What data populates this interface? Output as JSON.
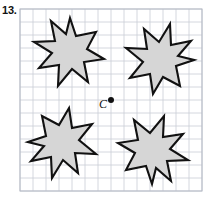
{
  "problem": {
    "number": "13."
  },
  "figure": {
    "type": "rotational-symmetry-grid",
    "center_label": "C",
    "grid": {
      "origin_x": 20,
      "origin_y": 9,
      "cell": 13,
      "cols": 14,
      "rows": 14,
      "line_color": "#c9cdd6",
      "border_color": "#b4b9c4"
    },
    "center_point": {
      "x": 111,
      "y": 100,
      "radius": 3,
      "color": "#111111"
    },
    "shape_style": {
      "fill": "#d6d6d6",
      "stroke": "#111111",
      "stroke_width": 2.1
    },
    "star_points": [
      [
        46,
        4
      ],
      [
        52,
        22
      ],
      [
        72,
        18
      ],
      [
        63,
        35
      ],
      [
        80,
        45
      ],
      [
        60,
        48
      ],
      [
        64,
        68
      ],
      [
        48,
        55
      ],
      [
        34,
        72
      ],
      [
        35,
        51
      ],
      [
        15,
        54
      ],
      [
        28,
        39
      ],
      [
        10,
        28
      ],
      [
        31,
        27
      ],
      [
        27,
        7
      ],
      [
        42,
        20
      ]
    ],
    "shapes": [
      {
        "name": "star-top-left",
        "rotation": 0,
        "translate_x": 24,
        "translate_y": 14
      },
      {
        "name": "star-top-right",
        "rotation": 90,
        "translate_x": 198,
        "translate_y": 14
      },
      {
        "name": "star-bottom-left",
        "rotation": 270,
        "translate_x": 24,
        "translate_y": 188
      },
      {
        "name": "star-bottom-right",
        "rotation": 180,
        "translate_x": 198,
        "translate_y": 188
      }
    ]
  }
}
